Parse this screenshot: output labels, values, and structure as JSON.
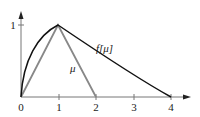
{
  "figure": {
    "type": "function-plot",
    "x_axis": {
      "ticks": [
        "0",
        "1",
        "2",
        "3",
        "4"
      ]
    },
    "y_axis": {
      "ticks": [
        "1"
      ]
    },
    "curves": [
      {
        "name": "mu",
        "label": "μ",
        "color": "#888888",
        "shape": "triangle",
        "points": [
          [
            0,
            0
          ],
          [
            1,
            1
          ],
          [
            2,
            0
          ]
        ]
      },
      {
        "name": "f-mu",
        "label": "f[μ]",
        "color": "#111111",
        "shape": "curved-triangle",
        "points": [
          [
            0,
            0
          ],
          [
            1,
            1
          ],
          [
            4,
            0
          ]
        ]
      }
    ]
  }
}
